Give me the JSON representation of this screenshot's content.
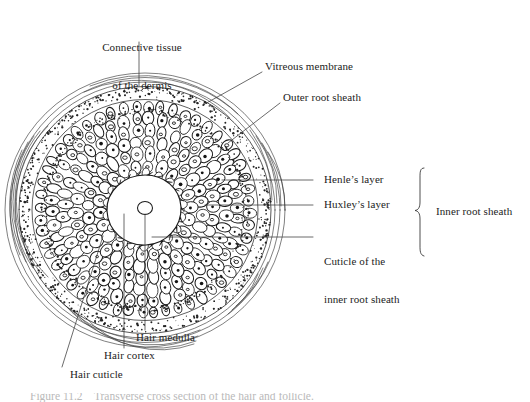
{
  "figure": {
    "caption_fragment": "Figure 11.2    Transverse cross section of the hair and follicle.",
    "background_color": "#ffffff",
    "ink_color": "#1a1a1a"
  },
  "labels": {
    "connective_tissue": "Connective tissue\nof the dermis",
    "connective_tissue_line1": "Connective tissue",
    "connective_tissue_line2": "of the dermis",
    "vitreous_membrane": "Vitreous membrane",
    "outer_root_sheath": "Outer root sheath",
    "henle_layer": "Henle’s layer",
    "huxley_layer": "Huxley’s layer",
    "cuticle_irs_line1": "Cuticle of the",
    "cuticle_irs_line2": "inner root sheath",
    "inner_root_sheath": "Inner root sheath",
    "hair_medulla": "Hair medulla",
    "hair_cortex": "Hair cortex",
    "hair_cuticle": "Hair cuticle"
  },
  "structure": {
    "layers": [
      {
        "name": "connective-tissue-of-dermis",
        "kind": "concentric-arcs"
      },
      {
        "name": "vitreous-membrane",
        "kind": "stipple-band"
      },
      {
        "name": "outer-root-sheath",
        "kind": "cell-rings"
      },
      {
        "name": "henle-layer",
        "kind": "cell-ring"
      },
      {
        "name": "huxley-layer",
        "kind": "cell-ring"
      },
      {
        "name": "cuticle-of-inner-root-sheath",
        "kind": "cell-ring"
      },
      {
        "name": "hair-cuticle",
        "kind": "hook-ring"
      },
      {
        "name": "hair-cortex",
        "kind": "solid-disc"
      },
      {
        "name": "hair-medulla",
        "kind": "small-disc"
      }
    ]
  },
  "geometry": {
    "center_x": 145,
    "center_y": 210,
    "outer_radius": 140,
    "cortex_radius": 30,
    "medulla_radius": 7
  },
  "icons": {
    "brace": "curly-brace-right"
  }
}
